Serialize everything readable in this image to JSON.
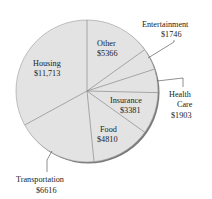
{
  "chart_data": {
    "type": "pie",
    "title": "",
    "currency": "$",
    "start_angle_deg": 0,
    "direction": "clockwise",
    "slices": [
      {
        "label": "Other",
        "value": 5366,
        "display": "$5366",
        "label_pos": "inside"
      },
      {
        "label": "Entertainment",
        "value": 1746,
        "display": "$1746",
        "label_pos": "outside"
      },
      {
        "label": "Health Care",
        "value": 1903,
        "display": "$1903",
        "label_pos": "outside"
      },
      {
        "label": "Insurance",
        "value": 3381,
        "display": "$3381",
        "label_pos": "inside"
      },
      {
        "label": "Food",
        "value": 4810,
        "display": "$4810",
        "label_pos": "inside"
      },
      {
        "label": "Transportation",
        "value": 6616,
        "display": "$6616",
        "label_pos": "outside"
      },
      {
        "label": "Housing",
        "value": 11713,
        "display": "$11,713",
        "label_pos": "inside"
      }
    ],
    "total": 35535,
    "legend": "none",
    "colors": {
      "fill": "#e3e3e3",
      "edge": "#8a8a8a",
      "shadow": "#7a7a7a",
      "leader": "#444444"
    }
  }
}
